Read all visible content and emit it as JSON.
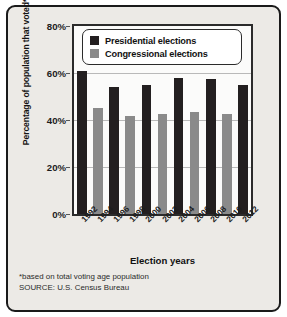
{
  "chart_data": {
    "type": "bar",
    "title": "",
    "xlabel": "Election years",
    "ylabel": "Percentage of population that voted*",
    "ylim": [
      0,
      80
    ],
    "yticks": [
      0,
      20,
      40,
      60,
      80
    ],
    "ytick_labels": [
      "0%",
      "20%",
      "40%",
      "60%",
      "80%"
    ],
    "grid": true,
    "legend_position": "top-center-inside",
    "categories": [
      "1992",
      "1994",
      "1996",
      "1998",
      "2000",
      "2002",
      "2004",
      "2006",
      "2008",
      "2010",
      "2012"
    ],
    "series": [
      {
        "name": "Presidential elections",
        "color": "#231f20",
        "values": [
          61,
          null,
          54,
          null,
          55,
          null,
          58,
          null,
          57.5,
          null,
          55
        ]
      },
      {
        "name": "Congressional elections",
        "color": "#8a8a8a",
        "values": [
          null,
          45,
          null,
          41.5,
          null,
          42.5,
          null,
          43.5,
          null,
          42.5,
          null
        ]
      }
    ],
    "bars": [
      {
        "year": "1992",
        "series": "Presidential elections",
        "value": 61
      },
      {
        "year": "1994",
        "series": "Congressional elections",
        "value": 45
      },
      {
        "year": "1996",
        "series": "Presidential elections",
        "value": 54
      },
      {
        "year": "1998",
        "series": "Congressional elections",
        "value": 41.5
      },
      {
        "year": "2000",
        "series": "Presidential elections",
        "value": 55
      },
      {
        "year": "2002",
        "series": "Congressional elections",
        "value": 42.5
      },
      {
        "year": "2004",
        "series": "Presidential elections",
        "value": 58
      },
      {
        "year": "2006",
        "series": "Congressional elections",
        "value": 43.5
      },
      {
        "year": "2008",
        "series": "Presidential elections",
        "value": 57.5
      },
      {
        "year": "2010",
        "series": "Congressional elections",
        "value": 42.5
      },
      {
        "year": "2012",
        "series": "Presidential elections",
        "value": 55
      }
    ],
    "annotations": [
      "*based on total voting age population",
      "SOURCE: U.S. Census Bureau"
    ]
  },
  "legend": {
    "items": [
      {
        "label": "Presidential elections",
        "color": "#231f20"
      },
      {
        "label": "Congressional elections",
        "color": "#8a8a8a"
      }
    ]
  },
  "notes": {
    "footnote": "*based on total voting age population",
    "source": "SOURCE: U.S. Census Bureau"
  }
}
